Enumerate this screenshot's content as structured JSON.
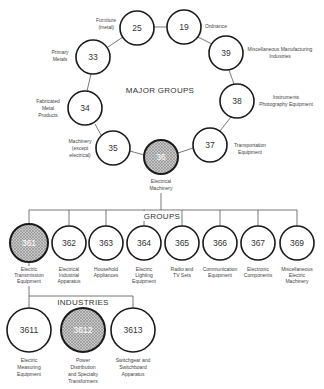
{
  "major_groups": {
    "heading": "MAJOR GROUPS",
    "nodes": [
      {
        "code": "25",
        "label": [
          "Furniture",
          "(metal)"
        ]
      },
      {
        "code": "19",
        "label": [
          "Ordnance"
        ]
      },
      {
        "code": "39",
        "label": [
          "Miscellaneous Manufacturing",
          "Industries"
        ]
      },
      {
        "code": "38",
        "label": [
          "Instruments",
          "Photography Equipment"
        ]
      },
      {
        "code": "37",
        "label": [
          "Transportation",
          "Equipment"
        ]
      },
      {
        "code": "36",
        "label": [
          "Electrical",
          "Machinery"
        ],
        "highlighted": true
      },
      {
        "code": "35",
        "label": [
          "Machinery",
          "(except",
          "electrical)"
        ]
      },
      {
        "code": "34",
        "label": [
          "Fabricated",
          "Metal",
          "Products"
        ]
      },
      {
        "code": "33",
        "label": [
          "Primary",
          "Metals"
        ]
      }
    ]
  },
  "groups": {
    "heading": "GROUPS",
    "nodes": [
      {
        "code": "361",
        "label": [
          "Electric",
          "Transmission",
          "Equipment"
        ],
        "highlighted": true
      },
      {
        "code": "362",
        "label": [
          "Electrical",
          "Industrial",
          "Apparatus"
        ]
      },
      {
        "code": "363",
        "label": [
          "Household",
          "Appliances"
        ]
      },
      {
        "code": "364",
        "label": [
          "Electric",
          "Lighting",
          "Equipment"
        ]
      },
      {
        "code": "365",
        "label": [
          "Radio and",
          "TV Sets"
        ]
      },
      {
        "code": "366",
        "label": [
          "Communication",
          "Equipment"
        ]
      },
      {
        "code": "367",
        "label": [
          "Electronic",
          "Components"
        ]
      },
      {
        "code": "369",
        "label": [
          "Miscellaneous",
          "Electric",
          "Machinery"
        ]
      }
    ]
  },
  "industries": {
    "heading": "INDUSTRIES",
    "nodes": [
      {
        "code": "3611",
        "label": [
          "Electric",
          "Measuring",
          "Equipment"
        ]
      },
      {
        "code": "3612",
        "label": [
          "Power",
          "Distribution",
          "and Specialty",
          "Transformers"
        ],
        "highlighted": true
      },
      {
        "code": "3613",
        "label": [
          "Switchgear and",
          "Switchboard",
          "Apparatus"
        ]
      }
    ]
  }
}
